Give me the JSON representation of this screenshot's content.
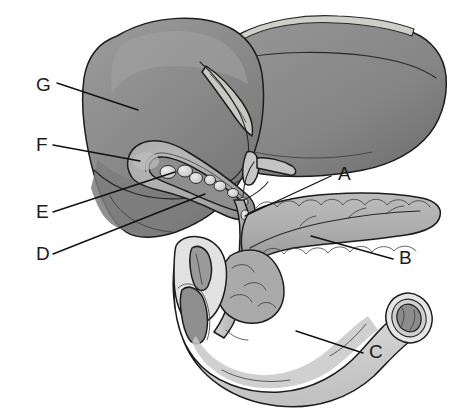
{
  "figure": {
    "background_color": "#ffffff",
    "ink_color": "#1a1a1a",
    "style": "grayscale medical line illustration with shading"
  },
  "labels": [
    {
      "id": "A",
      "text": "A",
      "x": 338,
      "y": 180,
      "target_x": 245,
      "target_y": 216
    },
    {
      "id": "B",
      "text": "B",
      "x": 399,
      "y": 264,
      "target_x": 311,
      "target_y": 236
    },
    {
      "id": "C",
      "text": "C",
      "x": 369,
      "y": 358,
      "target_x": 296,
      "target_y": 331
    },
    {
      "id": "D",
      "text": "D",
      "x": 36,
      "y": 260,
      "target_x": 205,
      "target_y": 194
    },
    {
      "id": "E",
      "text": "E",
      "x": 36,
      "y": 218,
      "target_x": 175,
      "target_y": 172
    },
    {
      "id": "F",
      "text": "F",
      "x": 36,
      "y": 151,
      "target_x": 140,
      "target_y": 161
    },
    {
      "id": "G",
      "text": "G",
      "x": 36,
      "y": 91,
      "target_x": 138,
      "target_y": 110
    }
  ],
  "organs": [
    {
      "name": "liver",
      "label_ref": "G",
      "fill": "#8a8a8a",
      "shade": "#787878",
      "highlight": "#9a9a9a"
    },
    {
      "name": "gallbladder",
      "label_ref": "F",
      "fill": "#a8a8a8",
      "shade": "#949494"
    },
    {
      "name": "gallstones",
      "label_ref": "E",
      "fill": "#d8d8d8",
      "shade": "#bdbdbd"
    },
    {
      "name": "common-bile-duct",
      "label_ref": "D",
      "fill": "#bfbfbf",
      "shade": "#a0a0a0"
    },
    {
      "name": "cystic-duct-junction",
      "label_ref": "A",
      "fill": "#c4c4c4"
    },
    {
      "name": "pancreas",
      "label_ref": "B",
      "fill": "#b0b0b0",
      "shade": "#9d9d9d"
    },
    {
      "name": "duodenum",
      "label_ref": "C",
      "fill": "#dcdcdc",
      "shade": "#c6c6c6"
    }
  ],
  "colors": {
    "liver": "#8a8a8a",
    "liver_dark": "#787878",
    "liver_light": "#9c9c9c",
    "falciform": "#c9c9c4",
    "gallbladder": "#a8a8a8",
    "stone": "#dadada",
    "duct": "#c0c0c0",
    "pancreas": "#b0b0b0",
    "pancreas_lobule": "#bdbdbd",
    "duodenum": "#dddddd",
    "duodenum_shade": "#c4c4c4",
    "lumen": "#8f8f8f",
    "outline": "#1c1c1c",
    "text": "#1a1a1a"
  }
}
